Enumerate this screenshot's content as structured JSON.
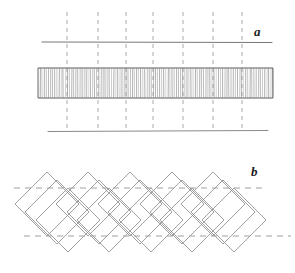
{
  "figure": {
    "width": 295,
    "height": 273,
    "background_color": "#ffffff",
    "panels": [
      {
        "id": "a",
        "label": "a",
        "label_x": 254,
        "label_y": 25,
        "description": "vertically hatched straight band between two reference lines with vertical dashed grid",
        "dashed_vertical_lines": {
          "color": "#a8a8a8",
          "y_top": 12,
          "y_bottom": 130,
          "x_positions": [
            67,
            98,
            126,
            153,
            183,
            213,
            242
          ],
          "dash_pattern": "4 4",
          "width": 1
        },
        "horizontal_lines": [
          {
            "name": "upper-reference-line",
            "x1": 42,
            "y1": 42,
            "x2": 272,
            "y2": 42.5,
            "color": "#767676",
            "width": 1
          },
          {
            "name": "lower-reference-line",
            "x1": 48,
            "y1": 131.5,
            "x2": 268,
            "y2": 130.5,
            "color": "#8a8a8a",
            "width": 1
          }
        ],
        "band": {
          "name": "hatched-band",
          "x_left": 38,
          "x_right": 273,
          "y_top": 68,
          "y_bottom": 98,
          "border_color": "#5a5a5a",
          "hatch_color": "#8f8f8f",
          "hatch_orientation": "vertical",
          "hatch_count": 112,
          "hatch_spacing": 2.1
        }
      },
      {
        "id": "b",
        "label": "b",
        "label_x": 251,
        "label_y": 165,
        "description": "chain of overlapping rotated squares (diamonds), alternate ones diagonally hatched, between two horizontal dashed reference lines",
        "dashed_horizontal_lines": {
          "color": "#a0a0a0",
          "dash_pattern": "6 5",
          "width": 1,
          "lines": [
            {
              "name": "upper-dashed-line",
              "x1": 14,
              "y1": 188,
              "x2": 266,
              "y2": 188
            },
            {
              "name": "lower-dashed-line",
              "x1": 24,
              "y1": 236,
              "x2": 291,
              "y2": 236
            }
          ]
        },
        "diamonds": {
          "outline_color": "#8a8a8a",
          "hatch_color": "#8a8a8a",
          "half_diagonal": 32,
          "upper_row": {
            "center_y": 204,
            "center_x_positions": [
              47,
              88,
              130,
              172,
              213
            ],
            "hatched": false
          },
          "lower_row": {
            "center_y": 220,
            "center_x_positions": [
              68,
              109,
              151,
              192,
              234
            ],
            "hatched": false
          },
          "hatched_row": {
            "center_y": 212,
            "center_x_positions": [
              57,
              99,
              140,
              182,
              223
            ],
            "hatched": true,
            "hatch_spacing": 2.2
          }
        }
      }
    ]
  }
}
